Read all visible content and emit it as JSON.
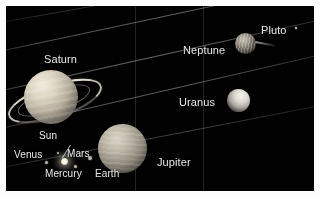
{
  "figure": {
    "kind": "solar-system-montage",
    "background_color": "#010101",
    "frame_color": "#fdfdfd",
    "label_color": "#e8e8e8"
  },
  "labels": {
    "saturn": "Saturn",
    "jupiter": "Jupiter",
    "uranus": "Uranus",
    "neptune": "Neptune",
    "pluto": "Pluto",
    "sun": "Sun",
    "mercury": "Mercury",
    "venus": "Venus",
    "earth": "Earth",
    "mars": "Mars"
  },
  "bodies": [
    {
      "name": "Saturn",
      "label": "Saturn",
      "x": 14,
      "y": 68,
      "size": 54,
      "has_rings": true
    },
    {
      "name": "Jupiter",
      "label": "Jupiter",
      "x": 98,
      "y": 124,
      "size": 49,
      "has_rings": false
    },
    {
      "name": "Uranus",
      "label": "Uranus",
      "x": 229,
      "y": 82,
      "size": 23,
      "has_rings": false
    },
    {
      "name": "Neptune",
      "label": "Neptune",
      "x": 235,
      "y": 33,
      "size": 21,
      "has_rings": false
    },
    {
      "name": "Pluto",
      "label": "Pluto",
      "x": 297,
      "y": 27,
      "size": 2,
      "has_rings": false
    },
    {
      "name": "Sun",
      "label": "Sun",
      "x": 61,
      "y": 158,
      "size": 7,
      "has_rings": false
    },
    {
      "name": "Mercury",
      "label": "Mercury",
      "x": 73,
      "y": 163,
      "size": 3,
      "has_rings": false
    },
    {
      "name": "Venus",
      "label": "Venus",
      "x": 45,
      "y": 160,
      "size": 3,
      "has_rings": false
    },
    {
      "name": "Earth",
      "label": "Earth",
      "x": 87,
      "y": 155,
      "size": 3,
      "has_rings": false
    },
    {
      "name": "Mars",
      "label": "Mars",
      "x": 56,
      "y": 150,
      "size": 2,
      "has_rings": false
    }
  ]
}
